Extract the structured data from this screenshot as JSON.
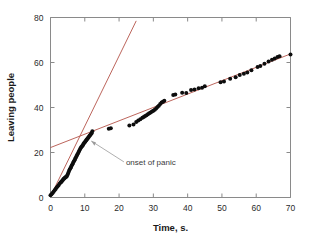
{
  "chart_data": {
    "type": "scatter",
    "title": "",
    "xlabel": "Time, s.",
    "ylabel": "Leaving people",
    "xlim": [
      0,
      70
    ],
    "ylim": [
      0,
      80
    ],
    "xticks": [
      0,
      10,
      20,
      30,
      40,
      50,
      60,
      70
    ],
    "yticks": [
      0,
      20,
      40,
      60,
      80
    ],
    "xtick_labels": [
      "0",
      "10",
      "20",
      "30",
      "40",
      "50",
      "60",
      "70"
    ],
    "ytick_labels": [
      "0",
      "20",
      "40",
      "60",
      "80"
    ],
    "grid": false,
    "legend": false,
    "marker_color": "#0d0d0d",
    "fit_line_color": "#b4534a",
    "frame_color": "#8a8a8a",
    "series": [
      {
        "name": "Leaving people",
        "marker": "filled-circle",
        "x": [
          0.0,
          0.3,
          0.6,
          0.9,
          1.2,
          1.5,
          1.8,
          2.1,
          2.4,
          2.7,
          3.0,
          3.2,
          3.4,
          3.6,
          3.8,
          4.0,
          4.2,
          4.4,
          4.6,
          4.8,
          5.0,
          5.2,
          5.4,
          5.6,
          5.8,
          6.0,
          6.2,
          6.4,
          6.6,
          6.8,
          7.0,
          7.2,
          7.4,
          7.6,
          7.8,
          8.0,
          8.2,
          8.4,
          8.6,
          8.8,
          9.0,
          9.2,
          9.4,
          9.6,
          9.8,
          10.0,
          10.2,
          10.4,
          10.6,
          10.8,
          11.0,
          11.2,
          11.4,
          11.6,
          11.8,
          12.0,
          12.2,
          17.0,
          17.6,
          23.0,
          24.2,
          25.0,
          25.6,
          26.2,
          26.8,
          27.2,
          27.6,
          28.0,
          28.4,
          28.8,
          29.2,
          29.6,
          30.0,
          30.4,
          30.8,
          31.2,
          31.6,
          32.0,
          32.4,
          32.8,
          33.2,
          35.8,
          36.4,
          38.4,
          39.6,
          41.0,
          42.0,
          43.2,
          44.2,
          45.0,
          49.6,
          50.6,
          52.4,
          54.0,
          55.2,
          56.4,
          57.4,
          58.6,
          60.4,
          61.2,
          62.4,
          63.6,
          64.6,
          65.4,
          66.2,
          66.8,
          70.0
        ],
        "y": [
          1.0,
          1.4,
          2.0,
          2.6,
          3.2,
          3.8,
          4.4,
          5.0,
          5.6,
          6.2,
          6.8,
          7.0,
          7.4,
          7.8,
          8.2,
          8.4,
          8.8,
          9.0,
          9.2,
          9.6,
          10.2,
          11.0,
          11.8,
          12.4,
          13.0,
          13.6,
          14.2,
          14.8,
          15.4,
          16.0,
          16.6,
          17.2,
          17.8,
          18.4,
          19.0,
          19.6,
          20.2,
          20.8,
          21.4,
          22.0,
          22.4,
          22.8,
          23.2,
          23.8,
          24.2,
          24.6,
          25.0,
          25.4,
          25.8,
          26.2,
          26.6,
          27.0,
          27.4,
          27.8,
          28.2,
          28.6,
          29.4,
          30.6,
          30.8,
          32.0,
          32.4,
          33.6,
          34.2,
          34.8,
          35.4,
          35.8,
          36.2,
          36.6,
          37.0,
          37.4,
          37.8,
          38.2,
          38.6,
          39.0,
          39.6,
          40.2,
          40.8,
          41.6,
          42.2,
          42.6,
          43.0,
          45.6,
          45.8,
          46.6,
          46.4,
          47.8,
          48.0,
          48.6,
          48.8,
          49.4,
          51.2,
          51.6,
          52.8,
          53.4,
          54.4,
          55.0,
          55.6,
          56.6,
          58.0,
          58.4,
          59.4,
          60.4,
          61.2,
          61.8,
          62.4,
          62.8,
          63.6
        ]
      }
    ],
    "fit_lines": [
      {
        "name": "pre-panic steep fit",
        "x1": 0.0,
        "y1": 0.5,
        "x2": 25.0,
        "y2": 78.5,
        "color": "#b4534a"
      },
      {
        "name": "post-panic shallow fit",
        "x1": 0.0,
        "y1": 22.2,
        "x2": 70.0,
        "y2": 63.8,
        "color": "#b4534a"
      }
    ],
    "annotations": [
      {
        "name": "onset-of-panic",
        "text": "onset of panic",
        "point_x": 11.6,
        "point_y": 26.0,
        "label_x": 22.0,
        "label_y": 14.5
      }
    ]
  }
}
